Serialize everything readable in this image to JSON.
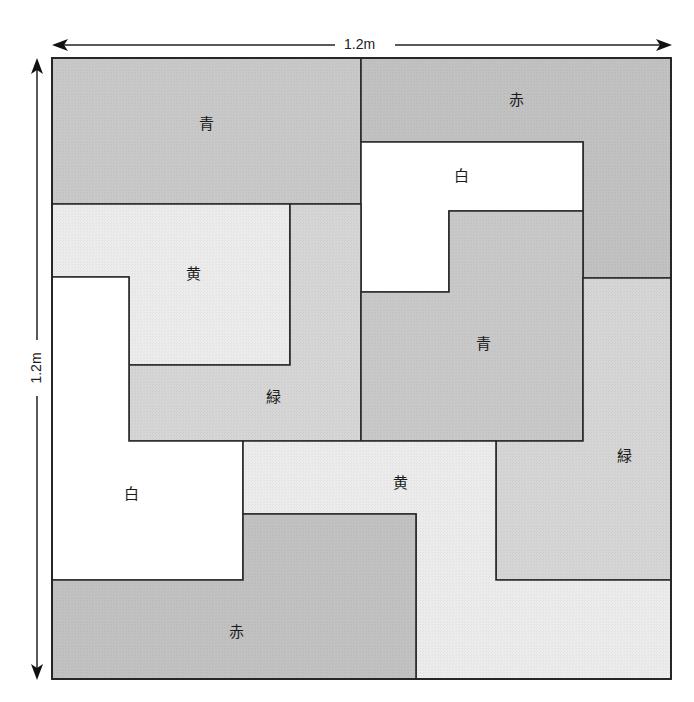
{
  "diagram": {
    "title": "",
    "outer_square": {
      "x": 52,
      "y": 58,
      "width": 619,
      "height": 621
    },
    "dimensions": {
      "width_label": "1.2m",
      "height_label": "1.2m"
    },
    "colors": {
      "青": "#c9c9c9",
      "赤": "#c2c2c2",
      "白": "#ffffff",
      "黄": "#ececec",
      "緑": "#d6d6d6"
    },
    "tiles": [
      {
        "id": "blue-top-left",
        "label": "青",
        "color_key": "青",
        "points": "52,58 361,58 361,204 52,204",
        "label_pos": [
          206,
          124
        ]
      },
      {
        "id": "red-top-right",
        "label": "赤",
        "color_key": "赤",
        "points": "361,58 671,58 671,278 583,278 583,142 361,142",
        "label_pos": [
          516,
          100
        ]
      },
      {
        "id": "white-top",
        "label": "白",
        "color_key": "白",
        "points": "361,142 583,142 583,211 449,211 449,292 361,292",
        "label_pos": [
          461,
          176
        ]
      },
      {
        "id": "yellow-left",
        "label": "黄",
        "color_key": "黄",
        "points": "52,204 290,204 290,365 129,365 129,277 52,277",
        "label_pos": [
          193,
          274
        ]
      },
      {
        "id": "green-left",
        "label": "緑",
        "color_key": "緑",
        "points": "290,204 361,204 361,441 129,441 129,365 290,365",
        "label_pos": [
          273,
          397
        ]
      },
      {
        "id": "blue-center",
        "label": "青",
        "color_key": "青",
        "points": "449,211 583,211 583,441 361,441 361,292 449,292",
        "label_pos": [
          483,
          344
        ]
      },
      {
        "id": "green-right",
        "label": "緑",
        "color_key": "緑",
        "points": "583,278 671,278 671,580 496,580 496,441 583,441",
        "label_pos": [
          624,
          456
        ]
      },
      {
        "id": "white-left",
        "label": "白",
        "color_key": "白",
        "points": "52,277 129,277 129,441 243,441 243,580 52,580",
        "label_pos": [
          131,
          494
        ]
      },
      {
        "id": "yellow-bottom",
        "label": "黄",
        "color_key": "黄",
        "points": "243,441 496,441 496,580 671,580 671,679 416,679 416,514 243,514",
        "label_pos": [
          400,
          483
        ]
      },
      {
        "id": "red-bottom",
        "label": "赤",
        "color_key": "赤",
        "points": "243,514 416,514 416,679 52,679 52,580 243,580",
        "label_pos": [
          236,
          632
        ]
      }
    ]
  }
}
